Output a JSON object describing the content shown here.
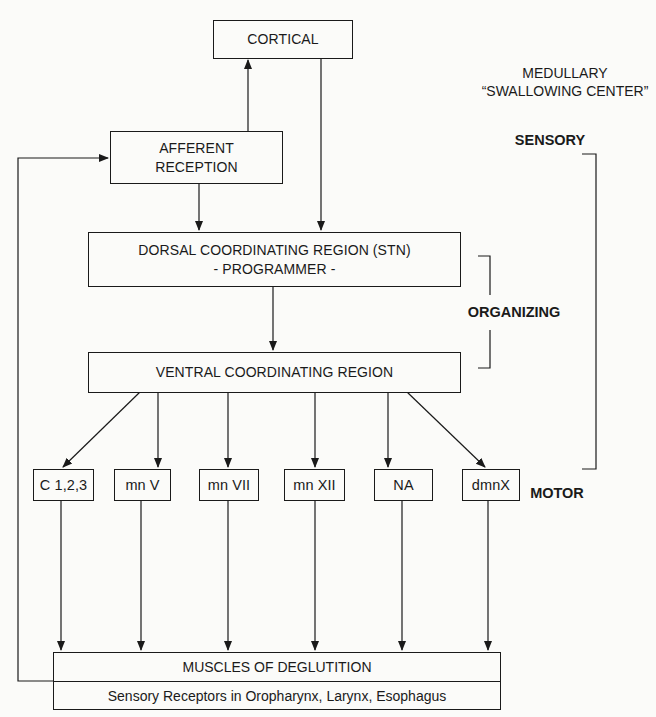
{
  "title": {
    "line1": "MEDULLARY",
    "line2": "“SWALLOWING CENTER”"
  },
  "phases": {
    "sensory": "SENSORY",
    "organizing": "ORGANIZING",
    "motor": "MOTOR"
  },
  "nodes": {
    "cortical": "CORTICAL",
    "afferent": {
      "line1": "AFFERENT",
      "line2": "RECEPTION"
    },
    "dorsal": {
      "line1": "DORSAL COORDINATING REGION (STN)",
      "line2": "- PROGRAMMER -"
    },
    "ventral": "VENTRAL COORDINATING REGION",
    "motor_nuclei": [
      "C 1,2,3",
      "mn V",
      "mn VII",
      "mn XII",
      "NA",
      "dmnX"
    ],
    "muscles": {
      "top": "MUSCLES OF DEGLUTITION",
      "bottom": "Sensory Receptors in Oropharynx, Larynx, Esophagus"
    }
  },
  "edges": [
    {
      "from": "afferent",
      "to": "cortical"
    },
    {
      "from": "cortical",
      "to": "dorsal"
    },
    {
      "from": "afferent",
      "to": "dorsal"
    },
    {
      "from": "dorsal",
      "to": "ventral"
    },
    {
      "from": "ventral",
      "to": "C 1,2,3"
    },
    {
      "from": "ventral",
      "to": "mn V"
    },
    {
      "from": "ventral",
      "to": "mn VII"
    },
    {
      "from": "ventral",
      "to": "mn XII"
    },
    {
      "from": "ventral",
      "to": "NA"
    },
    {
      "from": "ventral",
      "to": "dmnX"
    },
    {
      "from": "C 1,2,3",
      "to": "muscles"
    },
    {
      "from": "mn V",
      "to": "muscles"
    },
    {
      "from": "mn VII",
      "to": "muscles"
    },
    {
      "from": "mn XII",
      "to": "muscles"
    },
    {
      "from": "NA",
      "to": "muscles"
    },
    {
      "from": "dmnX",
      "to": "muscles"
    },
    {
      "from": "sensory receptors",
      "to": "afferent"
    }
  ]
}
